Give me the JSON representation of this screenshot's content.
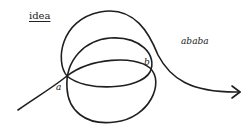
{
  "diagram": {
    "title": "idea",
    "labels": {
      "point_a": "a",
      "point_b": "b",
      "word": "ababa"
    },
    "stroke_color": "#1f1f1f",
    "background": "#ffffff"
  }
}
